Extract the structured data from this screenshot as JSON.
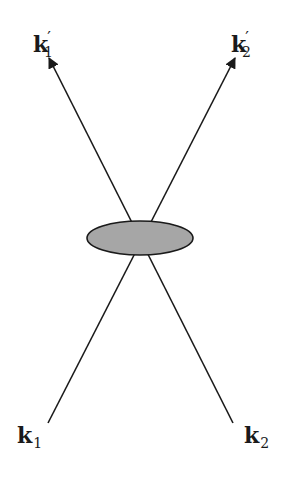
{
  "diagram": {
    "type": "scattering-vertex",
    "labels": {
      "k1_out": {
        "base": "k",
        "prime": "′",
        "sub": "1"
      },
      "k2_out": {
        "base": "k",
        "prime": "′",
        "sub": "2"
      },
      "k1_in": {
        "base": "k",
        "sub": "1"
      },
      "k2_in": {
        "base": "k",
        "sub": "2"
      }
    },
    "vertex": {
      "shape": "ellipse",
      "fill": "#a6a6a6",
      "stroke": "#1a1a1a"
    },
    "line_color": "#1a1a1a"
  }
}
